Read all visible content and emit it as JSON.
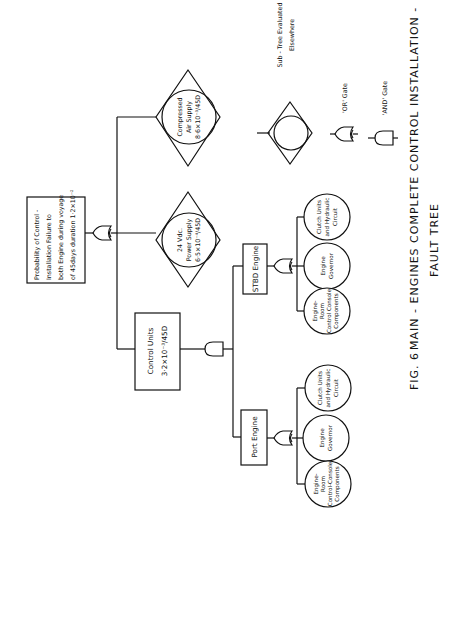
{
  "figure": {
    "caption_line1_fig": "FIG.  6",
    "caption_line1_title": "MAIN - ENGINES   COMPLETE   CONTROL   INSTALLATION -",
    "caption_line2": "FAULT TREE",
    "orientation": "rotated 90° counter-clockwise"
  },
  "top_event": {
    "lines": [
      "Probability of Control -",
      "Installation Failure to",
      "both Engine during voyage",
      "of 45days duration 1·2×10⁻²"
    ],
    "gate": "OR"
  },
  "subtrees": [
    {
      "id": "compressed-air",
      "lines": [
        "Compressed",
        "Air Supply",
        "8·6×10⁻³/45D"
      ]
    },
    {
      "id": "power-supply",
      "lines": [
        "24 Vdc.",
        "Power Supply",
        "6·5×10⁻⁴/45D"
      ]
    }
  ],
  "control_units": {
    "lines": [
      "Control  Units",
      "3·2×10⁻³/45D"
    ],
    "gate": "AND"
  },
  "engines": [
    {
      "id": "stbd",
      "label": "STBD  Engine",
      "gate": "OR",
      "events": [
        {
          "lines": [
            "Engine-",
            "Room",
            "Control Console",
            "Components"
          ]
        },
        {
          "lines": [
            "Engine",
            "Governor"
          ]
        },
        {
          "lines": [
            "Clutch Units",
            "and Hydraulic",
            "Circuit"
          ]
        }
      ]
    },
    {
      "id": "port",
      "label": "Port  Engine",
      "gate": "OR",
      "events": [
        {
          "lines": [
            "Engine-",
            "Room",
            "Control-Console",
            "Components"
          ]
        },
        {
          "lines": [
            "Engine",
            "Governor"
          ]
        },
        {
          "lines": [
            "Clutch Units",
            "and Hydraulic",
            "Circuit"
          ]
        }
      ]
    }
  ],
  "legend": {
    "subtree_label_1": "Sub - Tree  Evaluated",
    "subtree_label_2": "Elsewhere",
    "or_label": "'OR'  Gate",
    "and_label": "'AND'  Gate"
  }
}
